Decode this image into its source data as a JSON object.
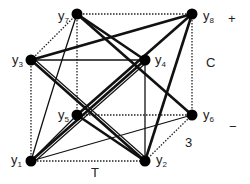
{
  "diagram": {
    "type": "cube-graph",
    "nodes": [
      {
        "id": "y1",
        "base": "y",
        "sub": "1",
        "x": 31,
        "y": 161
      },
      {
        "id": "y2",
        "base": "y",
        "sub": "2",
        "x": 145,
        "y": 161
      },
      {
        "id": "y3",
        "base": "y",
        "sub": "3",
        "x": 31,
        "y": 60
      },
      {
        "id": "y4",
        "base": "y",
        "sub": "4",
        "x": 145,
        "y": 60
      },
      {
        "id": "y5",
        "base": "y",
        "sub": "5",
        "x": 77,
        "y": 115
      },
      {
        "id": "y6",
        "base": "y",
        "sub": "6",
        "x": 192,
        "y": 115
      },
      {
        "id": "y7",
        "base": "y",
        "sub": "7",
        "x": 77,
        "y": 14
      },
      {
        "id": "y8",
        "base": "y",
        "sub": "8",
        "x": 192,
        "y": 14
      }
    ],
    "axis_labels": {
      "plus": "+",
      "c": "C",
      "minus": "−",
      "three": "3",
      "t": "T"
    },
    "edges": {
      "dotted": [
        [
          "y7",
          "y8"
        ],
        [
          "y7",
          "y5"
        ],
        [
          "y8",
          "y6"
        ],
        [
          "y3",
          "y1"
        ],
        [
          "y1",
          "y2"
        ],
        [
          "y5",
          "y6"
        ],
        [
          "y6",
          "y2"
        ],
        [
          "y3",
          "y7"
        ]
      ],
      "thin": [
        [
          "y3",
          "y4"
        ],
        [
          "y4",
          "y2"
        ],
        [
          "y1",
          "y6"
        ],
        [
          "y1",
          "y5"
        ],
        [
          "y7",
          "y2"
        ]
      ],
      "thick": [
        [
          "y7",
          "y4"
        ],
        [
          "y7",
          "y6"
        ],
        [
          "y3",
          "y8"
        ],
        [
          "y3",
          "y2"
        ],
        [
          "y1",
          "y4"
        ],
        [
          "y5",
          "y8"
        ],
        [
          "y5",
          "y2"
        ],
        [
          "y8",
          "y2"
        ]
      ]
    }
  }
}
